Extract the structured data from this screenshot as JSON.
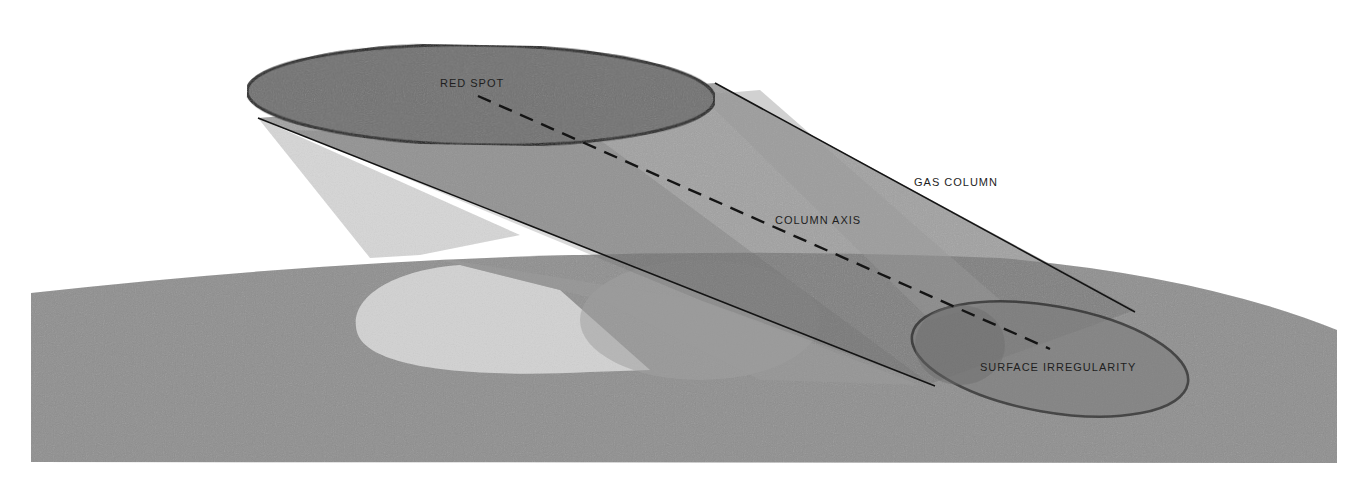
{
  "diagram": {
    "labels": {
      "red_spot": "RED SPOT",
      "gas_column": "GAS COLUMN",
      "column_axis": "COLUMN AXIS",
      "surface_irregularity": "SURFACE IRREGULARITY"
    },
    "colors": {
      "background": "#ffffff",
      "surface": "#8e8e8e",
      "red_spot_fill": "#6e6e6e",
      "column_fill": "#7d7d7d",
      "light_projection": "#d4d4d4",
      "outline": "#141414"
    }
  }
}
